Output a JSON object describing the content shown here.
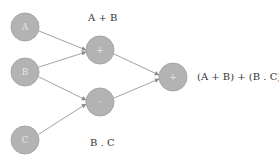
{
  "diagram": {
    "type": "logic-gate-network",
    "nodes": [
      {
        "id": "A",
        "label": "A",
        "x": 25,
        "y": 27,
        "r": 14
      },
      {
        "id": "B",
        "label": "B",
        "x": 25,
        "y": 72,
        "r": 14
      },
      {
        "id": "C",
        "label": "C",
        "x": 25,
        "y": 140,
        "r": 14
      },
      {
        "id": "sum",
        "label": "+",
        "x": 100,
        "y": 50,
        "r": 14
      },
      {
        "id": "prod",
        "label": "·",
        "x": 100,
        "y": 102,
        "r": 14
      },
      {
        "id": "out",
        "label": "+",
        "x": 173,
        "y": 77,
        "r": 14
      }
    ],
    "edges": [
      {
        "from": "A",
        "to": "sum"
      },
      {
        "from": "B",
        "to": "sum"
      },
      {
        "from": "B",
        "to": "prod"
      },
      {
        "from": "C",
        "to": "prod"
      },
      {
        "from": "sum",
        "to": "out"
      },
      {
        "from": "prod",
        "to": "out"
      }
    ],
    "labels": {
      "sum_label": "A + B",
      "prod_label": "B . C",
      "output_label": "(A + B) + (B . C)"
    },
    "colors": {
      "node_fill": "#b3b3b3",
      "edge": "#8c8c8c",
      "text": "#333333"
    }
  }
}
